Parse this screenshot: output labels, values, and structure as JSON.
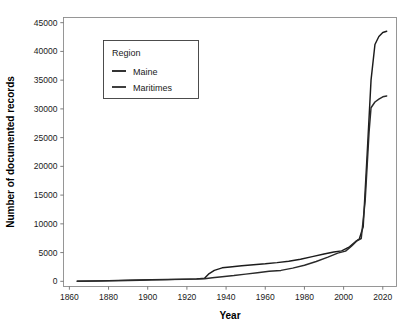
{
  "chart_data": {
    "type": "line",
    "title": "",
    "xlabel": "Year",
    "ylabel": "Number of documented records",
    "xlim": [
      1857,
      2027
    ],
    "ylim": [
      -900,
      45900
    ],
    "grid": false,
    "legend_position": "upper-left-inside",
    "legend_title": "Region",
    "xticks": [
      1860,
      1880,
      1900,
      1920,
      1940,
      1960,
      1980,
      2000,
      2020
    ],
    "xtick_labels": [
      "1860",
      "1880",
      "1900",
      "1920",
      "1940",
      "1960",
      "1980",
      "2000",
      "2020"
    ],
    "yticks": [
      0,
      5000,
      10000,
      15000,
      20000,
      25000,
      30000,
      35000,
      40000,
      45000
    ],
    "ytick_labels": [
      "0",
      "5000",
      "10000",
      "15000",
      "20000",
      "25000",
      "30000",
      "35000",
      "40000",
      "45000"
    ],
    "series": [
      {
        "name": "Maine",
        "color": "#1c1c1c",
        "x": [
          1864,
          1875,
          1885,
          1890,
          1896,
          1902,
          1910,
          1918,
          1925,
          1929,
          1931,
          1934,
          1938,
          1942,
          1948,
          1954,
          1960,
          1966,
          1972,
          1978,
          1984,
          1990,
          1995,
          1999,
          2003,
          2006,
          2008,
          2010,
          2012,
          2014,
          2016,
          2018,
          2020,
          2022
        ],
        "values": [
          40,
          80,
          150,
          190,
          240,
          290,
          330,
          380,
          430,
          520,
          1250,
          1900,
          2350,
          2500,
          2700,
          2900,
          3050,
          3250,
          3500,
          3850,
          4300,
          4750,
          5100,
          5300,
          6000,
          6900,
          7350,
          9500,
          22000,
          35000,
          41200,
          42600,
          43300,
          43500
        ]
      },
      {
        "name": "Maritimes",
        "color": "#2a2a2a",
        "x": [
          1864,
          1875,
          1885,
          1890,
          1896,
          1902,
          1910,
          1918,
          1925,
          1929,
          1933,
          1938,
          1944,
          1950,
          1956,
          1962,
          1968,
          1974,
          1980,
          1986,
          1992,
          1997,
          2001,
          2004,
          2007,
          2009,
          2011,
          2013,
          2014,
          2016,
          2018,
          2020,
          2022
        ],
        "values": [
          20,
          60,
          120,
          150,
          200,
          250,
          300,
          340,
          390,
          450,
          620,
          800,
          1000,
          1250,
          1500,
          1750,
          1900,
          2300,
          2800,
          3450,
          4200,
          4900,
          5250,
          6100,
          7100,
          7450,
          14000,
          26000,
          30200,
          31200,
          31700,
          32100,
          32250
        ]
      }
    ]
  },
  "axis": {
    "x_title": "Year",
    "y_title": "Number of documented records"
  },
  "legend": {
    "title": "Region",
    "entries": [
      {
        "label": "Maine"
      },
      {
        "label": "Maritimes"
      }
    ]
  },
  "colors": {
    "series_primary": "#1c1c1c",
    "series_secondary": "#2a2a2a",
    "plot_border": "#8c8c8c",
    "axis": "#6e6e6e",
    "text": "#1a1a1a",
    "background": "#ffffff"
  }
}
